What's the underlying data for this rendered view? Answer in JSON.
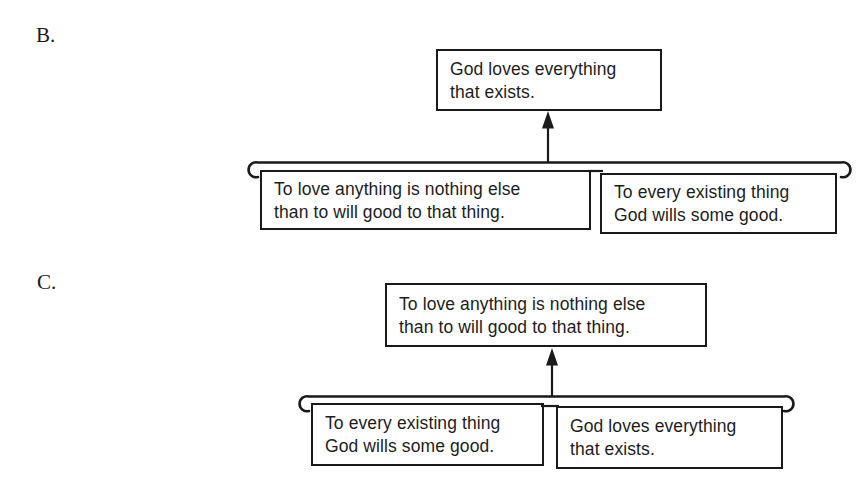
{
  "colors": {
    "ink": "#1a1a1a",
    "paper": "#ffffff"
  },
  "diagrams": [
    {
      "label": "B.",
      "conclusion": {
        "lines": [
          "God loves everything",
          "that exists."
        ]
      },
      "premise_left": {
        "lines": [
          "To love anything is nothing else",
          "than to will good to that thing."
        ]
      },
      "premise_right": {
        "lines": [
          "To every existing thing",
          "God wills some good."
        ]
      }
    },
    {
      "label": "C.",
      "conclusion": {
        "lines": [
          "To love anything is nothing else",
          "than to will good to that thing."
        ]
      },
      "premise_left": {
        "lines": [
          "To every existing thing",
          "God wills some good."
        ]
      },
      "premise_right": {
        "lines": [
          "God loves everything",
          "that exists."
        ]
      }
    }
  ]
}
